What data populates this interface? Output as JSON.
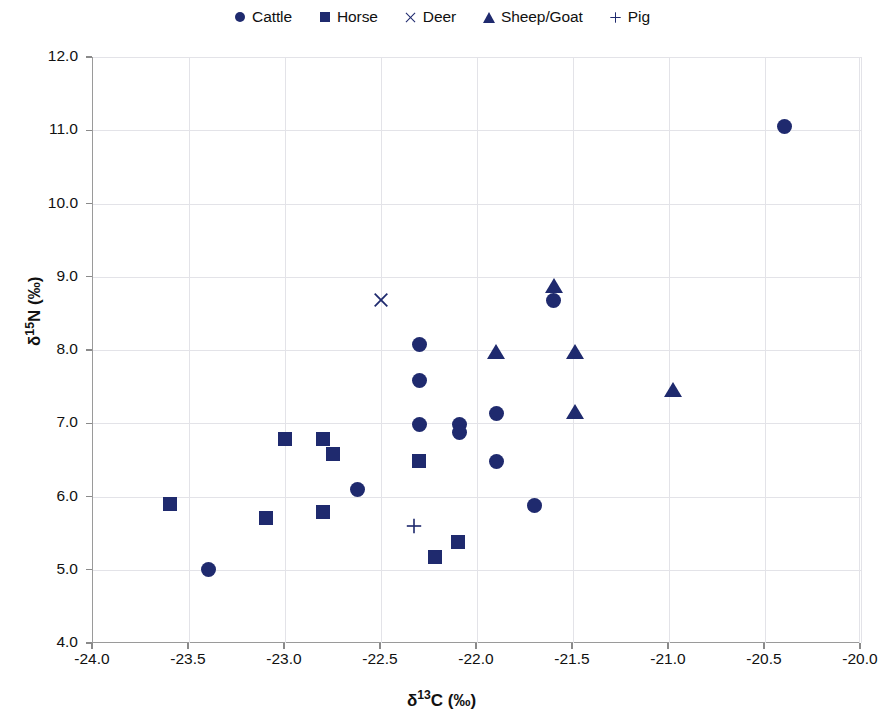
{
  "chart_data": {
    "type": "scatter",
    "title": "",
    "xlabel": "δ13C (‰)",
    "ylabel": "δ15N (‰)",
    "xlim": [
      -24.0,
      -20.0
    ],
    "ylim": [
      4.0,
      12.0
    ],
    "xticks": [
      "-24.0",
      "-23.5",
      "-23.0",
      "-22.5",
      "-22.0",
      "-21.5",
      "-21.0",
      "-20.5",
      "-20.0"
    ],
    "xtick_values": [
      -24.0,
      -23.5,
      -23.0,
      -22.5,
      -22.0,
      -21.5,
      -21.0,
      -20.5,
      -20.0
    ],
    "yticks": [
      "4.0",
      "5.0",
      "6.0",
      "7.0",
      "8.0",
      "9.0",
      "10.0",
      "11.0",
      "12.0"
    ],
    "ytick_values": [
      4.0,
      5.0,
      6.0,
      7.0,
      8.0,
      9.0,
      10.0,
      11.0,
      12.0
    ],
    "grid": true,
    "legend_position": "top-center",
    "marker_color": "#1f2a6e",
    "series": [
      {
        "name": "Cattle",
        "marker": "circle",
        "points": [
          [
            -23.4,
            5.0
          ],
          [
            -22.62,
            6.1
          ],
          [
            -22.3,
            8.08
          ],
          [
            -22.3,
            7.58
          ],
          [
            -22.3,
            6.98
          ],
          [
            -22.09,
            6.98
          ],
          [
            -22.09,
            6.88
          ],
          [
            -21.9,
            7.13
          ],
          [
            -21.9,
            6.48
          ],
          [
            -21.7,
            5.88
          ],
          [
            -21.6,
            8.67
          ],
          [
            -20.4,
            11.05
          ]
        ]
      },
      {
        "name": "Horse",
        "marker": "square",
        "points": [
          [
            -23.6,
            5.9
          ],
          [
            -23.1,
            5.7
          ],
          [
            -23.0,
            6.79
          ],
          [
            -22.8,
            6.79
          ],
          [
            -22.8,
            5.79
          ],
          [
            -22.75,
            6.58
          ],
          [
            -22.3,
            6.48
          ],
          [
            -22.22,
            5.18
          ],
          [
            -22.1,
            5.38
          ]
        ]
      },
      {
        "name": "Deer",
        "marker": "cross",
        "points": [
          [
            -22.5,
            8.68
          ]
        ]
      },
      {
        "name": "Sheep/Goat",
        "marker": "triangle",
        "points": [
          [
            -21.9,
            7.97
          ],
          [
            -21.6,
            8.88
          ],
          [
            -21.49,
            7.97
          ],
          [
            -21.49,
            7.16
          ],
          [
            -20.98,
            7.45
          ]
        ]
      },
      {
        "name": "Pig",
        "marker": "plus",
        "points": [
          [
            -22.33,
            5.6
          ]
        ]
      }
    ]
  },
  "legend": {
    "entries": [
      {
        "label": "Cattle",
        "marker": "circle"
      },
      {
        "label": "Horse",
        "marker": "square"
      },
      {
        "label": "Deer",
        "marker": "cross"
      },
      {
        "label": "Sheep/Goat",
        "marker": "triangle"
      },
      {
        "label": "Pig",
        "marker": "plus"
      }
    ]
  },
  "axis_labels": {
    "x_prefix": "δ",
    "x_sup": "13",
    "x_suffix": "C (‰)",
    "y_prefix": "δ",
    "y_sup": "15",
    "y_suffix": "N (‰)"
  }
}
